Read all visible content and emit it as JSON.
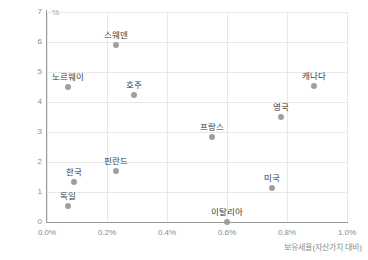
{
  "chart_data": {
    "type": "scatter",
    "title": "",
    "xlabel": "보유세율(자산가치 대비)",
    "ylabel": "",
    "y_unit": "%",
    "xlim": [
      0.0,
      1.0
    ],
    "ylim": [
      0,
      7
    ],
    "grid": true,
    "legend": "none",
    "x_ticks": [
      "0.0%",
      "0.2%",
      "0.4%",
      "0.6%",
      "0.8%",
      "1.0%"
    ],
    "x_tick_values": [
      0.0,
      0.2,
      0.4,
      0.6,
      0.8,
      1.0
    ],
    "y_ticks": [
      "0",
      "1",
      "2",
      "3",
      "4",
      "5",
      "6",
      "7"
    ],
    "y_tick_values": [
      0,
      1,
      2,
      3,
      4,
      5,
      6,
      7
    ],
    "point_color": "#9e9e9e",
    "points": [
      {
        "label": "스웨덴",
        "x": 0.23,
        "y": 5.9
      },
      {
        "label": "노르웨이",
        "x": 0.07,
        "y": 4.5
      },
      {
        "label": "호주",
        "x": 0.29,
        "y": 4.25
      },
      {
        "label": "캐나다",
        "x": 0.89,
        "y": 4.55
      },
      {
        "label": "영국",
        "x": 0.78,
        "y": 3.5
      },
      {
        "label": "프랑스",
        "x": 0.55,
        "y": 2.85
      },
      {
        "label": "미국",
        "x": 0.75,
        "y": 1.15
      },
      {
        "label": "핀란드",
        "x": 0.23,
        "y": 1.7
      },
      {
        "label": "한국",
        "x": 0.09,
        "y": 1.35
      },
      {
        "label": "독일",
        "x": 0.07,
        "y": 0.55
      },
      {
        "label": "이탈리아",
        "x": 0.6,
        "y": 0.0
      }
    ]
  }
}
